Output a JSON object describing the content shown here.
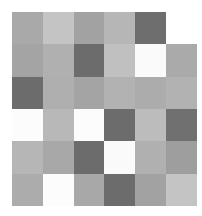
{
  "grid": {
    "rows": 6,
    "cols": 6,
    "cells": [
      [
        "#a9a9a9",
        "#c4c4c4",
        "#a2a2a2",
        "#b6b6b6",
        "#6e6e6e",
        "#ffffff"
      ],
      [
        "#a4a4a4",
        "#b0b0b0",
        "#6c6c6c",
        "#c0c0c0",
        "#fafafa",
        "#aaaaaa"
      ],
      [
        "#6c6c6c",
        "#afafaf",
        "#a4a4a4",
        "#b2b2b2",
        "#acacac",
        "#b2b2b2"
      ],
      [
        "#fcfcfc",
        "#b8b8b8",
        "#fcfcfc",
        "#6c6c6c",
        "#bcbcbc",
        "#707070"
      ],
      [
        "#b6b6b6",
        "#a8a8a8",
        "#6c6c6c",
        "#fafafa",
        "#b0b0b0",
        "#9e9e9e"
      ],
      [
        "#acacac",
        "#fcfcfc",
        "#a8a8a8",
        "#6c6c6c",
        "#a2a2a2",
        "#c4c4c4"
      ]
    ]
  }
}
